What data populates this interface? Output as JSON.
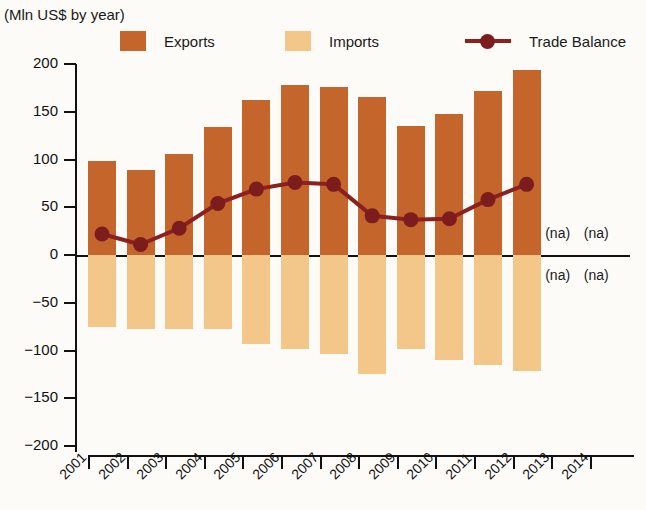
{
  "chart_data": {
    "type": "bar",
    "title": "Exports, Imports and Trade Balance, by year",
    "subtitle": "(Mln US$ by year)",
    "xlabel": "",
    "ylabel": "",
    "ylim": [
      -200,
      200
    ],
    "ytick_labels": [
      "200",
      "150",
      "100",
      "50",
      "0",
      "−50",
      "−100",
      "−150",
      "−200"
    ],
    "ytick_values": [
      200,
      150,
      100,
      50,
      0,
      -50,
      -100,
      -150,
      -200
    ],
    "grid": false,
    "legend_position": "top",
    "categories": [
      "2001",
      "2002",
      "2003",
      "2004",
      "2005",
      "2006",
      "2007",
      "2008",
      "2009",
      "2010",
      "2011",
      "2012",
      "2013",
      "2014"
    ],
    "series": [
      {
        "name": "Exports",
        "type": "bar",
        "color": "#c4662c",
        "values": [
          98,
          89,
          106,
          134,
          162,
          178,
          176,
          165,
          135,
          148,
          172,
          194,
          null,
          null
        ]
      },
      {
        "name": "Imports",
        "type": "bar",
        "color": "#f3c68a",
        "values": [
          -75,
          -78,
          -77,
          -78,
          -93,
          -98,
          -104,
          -125,
          -98,
          -110,
          -115,
          -121,
          null,
          null
        ]
      },
      {
        "name": "Trade Balance",
        "type": "line",
        "color": "#8b2020",
        "values": [
          22,
          11,
          28,
          54,
          69,
          76,
          74,
          41,
          37,
          38,
          58,
          74,
          null,
          null
        ]
      }
    ],
    "na_labels": [
      {
        "text": "(na)",
        "year": "2013",
        "side": "above"
      },
      {
        "text": "(na)",
        "year": "2014",
        "side": "above"
      },
      {
        "text": "(na)",
        "year": "2013",
        "side": "below"
      },
      {
        "text": "(na)",
        "year": "2014",
        "side": "below"
      }
    ]
  },
  "legend": {
    "exports_label": "Exports",
    "imports_label": "Imports",
    "balance_label": "Trade Balance"
  },
  "colors": {
    "exports": "#c4662c",
    "imports": "#f3c68a",
    "balance": "#8b2020",
    "background": "#fcfbf8",
    "axis": "#111111"
  }
}
